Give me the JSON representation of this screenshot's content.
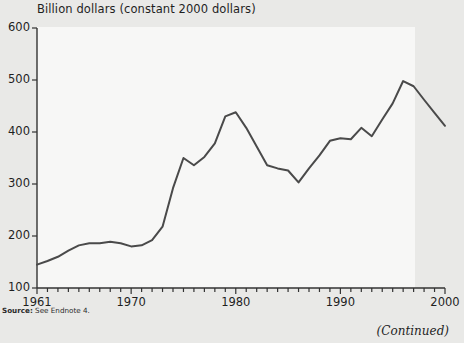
{
  "chart_data": {
    "type": "line",
    "title": "Billion dollars (constant 2000 dollars)",
    "xlabel": "",
    "ylabel": "",
    "xlim": [
      1961,
      2000
    ],
    "ylim": [
      100,
      600
    ],
    "grid": false,
    "legend": null,
    "yticks": [
      100,
      200,
      300,
      400,
      500,
      600
    ],
    "xticks": [
      1961,
      1970,
      1980,
      1990,
      2000
    ],
    "xtick_labels": [
      "1961",
      "1970",
      "1980",
      "1990",
      "2000"
    ],
    "minor_xticks_every": 1,
    "series": [
      {
        "name": "Billion dollars (constant 2000 dollars)",
        "color": "#4a4a4a",
        "x": [
          1961,
          1962,
          1963,
          1964,
          1965,
          1966,
          1967,
          1968,
          1969,
          1970,
          1971,
          1972,
          1973,
          1974,
          1975,
          1976,
          1977,
          1978,
          1979,
          1980,
          1981,
          1982,
          1983,
          1984,
          1985,
          1986,
          1987,
          1988,
          1989,
          1990,
          1991,
          1992,
          1993,
          1994,
          1995,
          1996,
          1997,
          1998,
          1999,
          2000
        ],
        "y": [
          145,
          152,
          160,
          172,
          182,
          186,
          186,
          189,
          186,
          180,
          182,
          192,
          218,
          292,
          350,
          336,
          352,
          378,
          430,
          438,
          408,
          372,
          336,
          330,
          326,
          303,
          330,
          355,
          383,
          388,
          386,
          408,
          392,
          424,
          455,
          498,
          488,
          462,
          437,
          412
        ]
      }
    ]
  },
  "notes": {
    "source_label": "Source:",
    "source_text": "See Endnote 4.",
    "continued": "(Continued)"
  },
  "colors": {
    "page_background": "#e9e9e7",
    "panel_background": "#f7f7f6",
    "axis": "#333333",
    "line": "#4a4a4a",
    "text": "#1f1f1f"
  }
}
